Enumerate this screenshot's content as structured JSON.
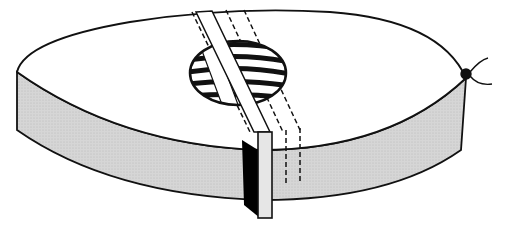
{
  "figure": {
    "colors": {
      "outline": "#111111",
      "top_face": "#ffffff",
      "side_face": "#d4d4d4",
      "strip_face": "#ffffff",
      "strip_end_front": "#e6e6e6",
      "strip_shadow": "#000000"
    },
    "elements": [
      "disk-top-face",
      "disk-side-wall",
      "window-circle",
      "striped-bands",
      "strip",
      "dashed-hidden-strips",
      "knot-with-wires"
    ]
  }
}
